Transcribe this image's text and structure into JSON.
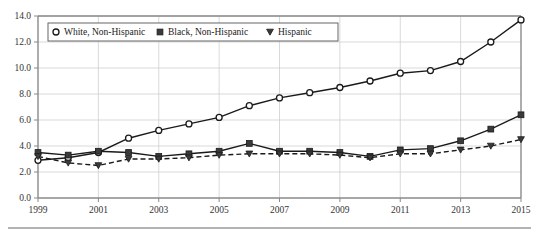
{
  "chart_data": {
    "type": "line",
    "title": "",
    "subtitle": "",
    "xlabel": "",
    "ylabel": "",
    "xlim": [
      1999,
      2015
    ],
    "ylim": [
      0.0,
      14.0
    ],
    "grid": true,
    "legend_position": "top-left-inside",
    "x": [
      1999,
      2000,
      2001,
      2002,
      2003,
      2004,
      2005,
      2006,
      2007,
      2008,
      2009,
      2010,
      2011,
      2012,
      2013,
      2014,
      2015
    ],
    "xtick_labels": [
      "1999",
      "2001",
      "2003",
      "2005",
      "2007",
      "2009",
      "2011",
      "2013",
      "2015"
    ],
    "xtick_values": [
      1999,
      2001,
      2003,
      2005,
      2007,
      2009,
      2011,
      2013,
      2015
    ],
    "ytick_labels": [
      "0.0",
      "2.0",
      "4.0",
      "6.0",
      "8.0",
      "10.0",
      "12.0",
      "14.0"
    ],
    "ytick_values": [
      0.0,
      2.0,
      4.0,
      6.0,
      8.0,
      10.0,
      12.0,
      14.0
    ],
    "series": [
      {
        "name": "White, Non-Hispanic",
        "marker": "open-circle",
        "linestyle": "solid",
        "color": "#1a1a1a",
        "values": [
          2.9,
          3.1,
          3.5,
          4.6,
          5.2,
          5.7,
          6.2,
          7.1,
          7.7,
          8.1,
          8.5,
          9.0,
          9.6,
          9.8,
          10.5,
          12.0,
          13.7
        ]
      },
      {
        "name": "Black, Non-Hispanic",
        "marker": "filled-square",
        "linestyle": "solid",
        "color": "#3a3a3a",
        "values": [
          3.5,
          3.3,
          3.6,
          3.5,
          3.2,
          3.4,
          3.6,
          4.2,
          3.6,
          3.6,
          3.5,
          3.2,
          3.7,
          3.8,
          4.4,
          5.3,
          6.4
        ]
      },
      {
        "name": "Hispanic",
        "marker": "filled-triangle",
        "linestyle": "dashed",
        "color": "#1a1a1a",
        "values": [
          3.2,
          2.7,
          2.5,
          3.0,
          3.0,
          3.1,
          3.3,
          3.4,
          3.4,
          3.4,
          3.3,
          3.1,
          3.4,
          3.4,
          3.7,
          4.0,
          4.5
        ]
      }
    ]
  },
  "legend": {
    "items": [
      {
        "label": "White, Non-Hispanic",
        "marker": "open-circle"
      },
      {
        "label": "Black, Non-Hispanic",
        "marker": "filled-square"
      },
      {
        "label": "Hispanic",
        "marker": "filled-triangle"
      }
    ]
  }
}
